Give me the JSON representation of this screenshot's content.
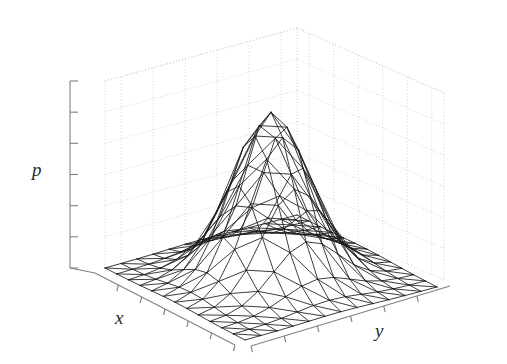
{
  "figure": {
    "title": "",
    "background_color": "#ffffff",
    "width": 507,
    "height": 364
  },
  "axes": {
    "x": {
      "label": "x",
      "ticks": 6,
      "range": [
        -3,
        3
      ],
      "tick_labels": []
    },
    "y": {
      "label": "y",
      "ticks": 6,
      "range": [
        -3,
        3
      ],
      "tick_labels": []
    },
    "z": {
      "label": "p",
      "ticks": 6,
      "range": [
        0,
        0.18
      ],
      "tick_labels": []
    }
  },
  "style": {
    "mesh_line_color": "#1a1a1a",
    "axis_line_color": "#808080",
    "grid_line_color": "#c8c8c8",
    "grid_style": "dotted",
    "label_color": "#2b2b2b"
  },
  "chart_data": {
    "type": "surface",
    "title": "",
    "xlabel": "x",
    "ylabel": "y",
    "zlabel": "p",
    "function": "p(x,y) = (1/(2*pi*sigma^2)) * exp(-(x^2 + y^2)/(2*sigma^2))",
    "sigma": 1.0,
    "peak_value": 0.159,
    "peak_location": [
      0,
      0
    ],
    "grid_n": 13,
    "xlim": [
      -3,
      3
    ],
    "ylim": [
      -3,
      3
    ],
    "zlim": [
      0,
      0.18
    ],
    "grid": true,
    "legend": "none",
    "mesh_type": "triangulated-quads",
    "projection": {
      "azimuth_deg": 45,
      "elevation_deg": 28
    }
  }
}
